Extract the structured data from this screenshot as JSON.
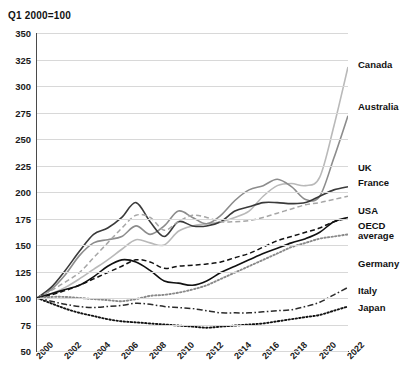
{
  "subtitle": "Q1 2000=100",
  "axis": {
    "y_ticks": [
      "350",
      "325",
      "300",
      "275",
      "250",
      "225",
      "200",
      "175",
      "150",
      "125",
      "100",
      "75",
      "50"
    ],
    "x_ticks": [
      "2000",
      "2002",
      "2004",
      "2006",
      "2008",
      "2010",
      "2012",
      "2014",
      "2016",
      "2018",
      "2020",
      "2022"
    ]
  },
  "labels": {
    "canada": "Canada",
    "australia": "Australia",
    "uk": "UK",
    "france": "France",
    "usa": "USA",
    "oecd_line1": "OECD",
    "oecd_line2": "average",
    "germany": "Germany",
    "italy": "Italy",
    "japan": "Japan"
  },
  "colors": {
    "canada": "#b9b9b9",
    "australia": "#8c8c8c",
    "uk": "#3a3a3a",
    "france": "#a6a6a6",
    "usa": "#111111",
    "oecd": "#111111",
    "germany": "#8a8a8a",
    "italy": "#2b2b2b",
    "japan": "#111111",
    "grid": "#d8d8d8",
    "axis": "#4a4a4a"
  },
  "chart_data": {
    "type": "line",
    "title": "",
    "subtitle": "Q1 2000=100",
    "xlabel": "",
    "ylabel": "",
    "xlim": [
      2000,
      2022
    ],
    "ylim": [
      50,
      350
    ],
    "ytick_step": 25,
    "grid": true,
    "legend": "right-inline-labels",
    "x": [
      2000,
      2001,
      2002,
      2003,
      2004,
      2005,
      2006,
      2007,
      2008,
      2009,
      2010,
      2011,
      2012,
      2013,
      2014,
      2015,
      2016,
      2017,
      2018,
      2019,
      2020,
      2021,
      2022
    ],
    "series": [
      {
        "name": "Canada",
        "style": "solid",
        "color": "#b9b9b9",
        "values": [
          100,
          104,
          110,
          118,
          127,
          136,
          146,
          155,
          152,
          150,
          163,
          168,
          170,
          172,
          176,
          182,
          196,
          206,
          208,
          206,
          214,
          262,
          318
        ]
      },
      {
        "name": "Australia",
        "style": "solid",
        "color": "#8c8c8c",
        "values": [
          100,
          108,
          122,
          140,
          152,
          155,
          158,
          168,
          160,
          168,
          182,
          176,
          170,
          178,
          192,
          202,
          206,
          212,
          205,
          193,
          196,
          232,
          272
        ]
      },
      {
        "name": "UK",
        "style": "solid",
        "color": "#3a3a3a",
        "values": [
          100,
          110,
          126,
          144,
          160,
          166,
          176,
          190,
          172,
          158,
          172,
          168,
          168,
          172,
          182,
          186,
          190,
          190,
          189,
          190,
          196,
          202,
          205
        ]
      },
      {
        "name": "France",
        "style": "dashed",
        "color": "#a6a6a6",
        "values": [
          100,
          107,
          115,
          124,
          138,
          152,
          166,
          178,
          176,
          164,
          172,
          178,
          176,
          172,
          172,
          173,
          176,
          180,
          184,
          188,
          190,
          193,
          196
        ]
      },
      {
        "name": "USA",
        "style": "solid",
        "color": "#111111",
        "values": [
          100,
          104,
          108,
          112,
          120,
          130,
          136,
          134,
          126,
          116,
          114,
          112,
          116,
          124,
          130,
          136,
          142,
          147,
          152,
          156,
          162,
          172,
          176
        ]
      },
      {
        "name": "OECD average",
        "style": "dashed",
        "color": "#111111",
        "values": [
          100,
          103,
          107,
          112,
          118,
          124,
          130,
          136,
          134,
          128,
          130,
          131,
          132,
          134,
          138,
          142,
          148,
          154,
          158,
          162,
          166,
          172,
          175
        ]
      },
      {
        "name": "Germany",
        "style": "dotted",
        "color": "#8a8a8a",
        "values": [
          100,
          101,
          101,
          100,
          99,
          98,
          97,
          99,
          102,
          103,
          105,
          108,
          112,
          118,
          124,
          130,
          136,
          142,
          148,
          152,
          156,
          158,
          160
        ]
      },
      {
        "name": "Italy",
        "style": "dashdot",
        "color": "#2b2b2b",
        "values": [
          100,
          97,
          94,
          92,
          91,
          92,
          93,
          95,
          94,
          92,
          91,
          90,
          88,
          86,
          86,
          86,
          87,
          88,
          89,
          92,
          96,
          103,
          110
        ]
      },
      {
        "name": "Japan",
        "style": "dotted",
        "color": "#111111",
        "values": [
          100,
          95,
          90,
          86,
          83,
          80,
          78,
          77,
          76,
          75,
          74,
          73,
          72,
          73,
          74,
          75,
          76,
          78,
          80,
          82,
          84,
          88,
          92
        ]
      }
    ]
  }
}
